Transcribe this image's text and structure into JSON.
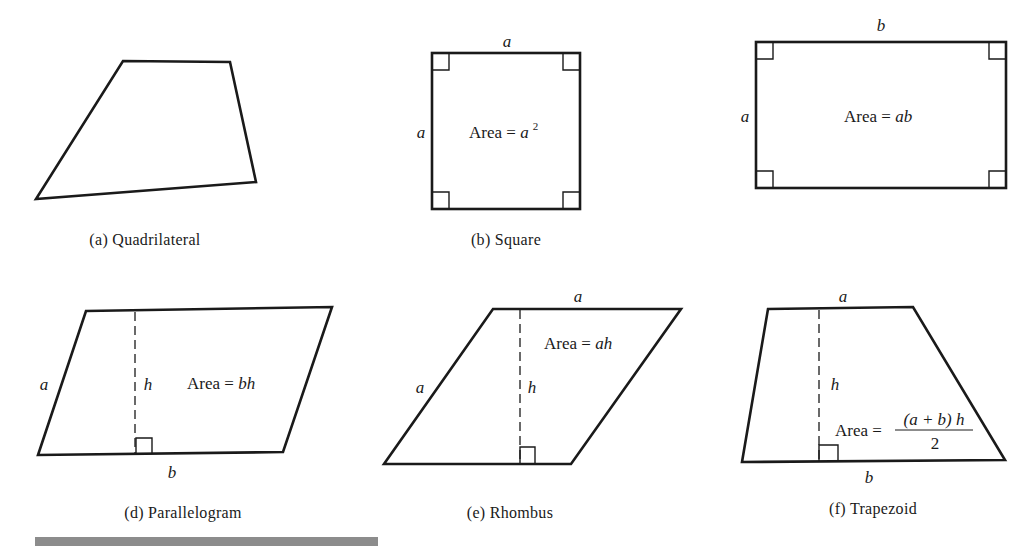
{
  "figures": {
    "quadrilateral": {
      "caption": "(a)  Quadrilateral"
    },
    "square": {
      "caption": "(b)  Square",
      "side_top": "a",
      "side_left": "a",
      "area_prefix": "Area = ",
      "area_var": "a",
      "area_exp": "2"
    },
    "rectangle": {
      "side_top": "b",
      "side_left": "a",
      "area_prefix": "Area = ",
      "area_var": "ab"
    },
    "parallelogram": {
      "caption": "(d)  Parallelogram",
      "side_left": "a",
      "side_bottom": "b",
      "height_label": "h",
      "area_prefix": "Area = ",
      "area_var": "bh"
    },
    "rhombus": {
      "caption": "(e)  Rhombus",
      "side_top": "a",
      "side_left": "a",
      "height_label": "h",
      "area_prefix": "Area = ",
      "area_var": "ah"
    },
    "trapezoid": {
      "caption": "(f)  Trapezoid",
      "side_top": "a",
      "side_bottom": "b",
      "height_label": "h",
      "area_prefix": "Area = ",
      "area_numerator": "(a + b) h",
      "area_denominator": "2"
    }
  }
}
